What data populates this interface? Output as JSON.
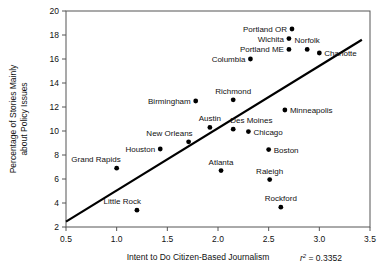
{
  "chart_data": {
    "type": "scatter",
    "title": "",
    "xlabel": "Intent to Do Citizen-Based Journalism",
    "ylabel_line1": "Percentage of Stories Mainly",
    "ylabel_line2": "about Policy Issues",
    "xlim": [
      0.5,
      3.5
    ],
    "ylim": [
      2,
      20
    ],
    "xticks": [
      0.5,
      1.0,
      1.5,
      2.0,
      2.5,
      3.0,
      3.5
    ],
    "xtick_labels": [
      "0.5",
      "1.0",
      "1.5",
      "2.0",
      "2.5",
      "3.0",
      "3.5"
    ],
    "yticks": [
      2,
      4,
      6,
      8,
      10,
      12,
      14,
      16,
      18,
      20
    ],
    "ytick_labels": [
      "2",
      "4",
      "6",
      "8",
      "10",
      "12",
      "14",
      "16",
      "18",
      "20"
    ],
    "grid": false,
    "legend": "none",
    "annotation_r2_label": "r",
    "annotation_r2_sup": "2",
    "annotation_r2_value": "= 0.3352",
    "annotation_r2_full": "r2 = 0.3352",
    "fit_line": {
      "x_start": 0.5,
      "y_start": 2.45,
      "x_end": 3.42,
      "y_end": 17.6
    },
    "points": [
      {
        "name": "Portland OR",
        "x": 2.73,
        "y": 18.5,
        "label_pos": "left"
      },
      {
        "name": "Wichita",
        "x": 2.7,
        "y": 17.7,
        "label_pos": "left"
      },
      {
        "name": "Norfolk",
        "x": 2.88,
        "y": 16.8,
        "label_pos": "above"
      },
      {
        "name": "Portland ME",
        "x": 2.7,
        "y": 16.8,
        "label_pos": "left"
      },
      {
        "name": "Charlotte",
        "x": 3.0,
        "y": 16.5,
        "label_pos": "right"
      },
      {
        "name": "Columbia",
        "x": 2.32,
        "y": 16.0,
        "label_pos": "left"
      },
      {
        "name": "Richmond",
        "x": 2.15,
        "y": 12.6,
        "label_pos": "above"
      },
      {
        "name": "Birmingham",
        "x": 1.78,
        "y": 12.5,
        "label_pos": "left"
      },
      {
        "name": "Minneapolis",
        "x": 2.66,
        "y": 11.75,
        "label_pos": "right"
      },
      {
        "name": "Austin",
        "x": 1.92,
        "y": 10.3,
        "label_pos": "above"
      },
      {
        "name": "Des Moines",
        "x": 2.15,
        "y": 10.15,
        "label_pos": "above-right"
      },
      {
        "name": "Chicago",
        "x": 2.3,
        "y": 9.95,
        "label_pos": "right"
      },
      {
        "name": "New Orleans",
        "x": 1.71,
        "y": 9.1,
        "label_pos": "above-left"
      },
      {
        "name": "Houston",
        "x": 1.43,
        "y": 8.5,
        "label_pos": "left"
      },
      {
        "name": "Boston",
        "x": 2.5,
        "y": 8.45,
        "label_pos": "right"
      },
      {
        "name": "Grand Rapids",
        "x": 1.0,
        "y": 6.9,
        "label_pos": "above-left"
      },
      {
        "name": "Atlanta",
        "x": 2.03,
        "y": 6.7,
        "label_pos": "above"
      },
      {
        "name": "Raleigh",
        "x": 2.51,
        "y": 5.95,
        "label_pos": "above"
      },
      {
        "name": "Rockford",
        "x": 2.62,
        "y": 3.65,
        "label_pos": "above"
      },
      {
        "name": "Little Rock",
        "x": 1.2,
        "y": 3.4,
        "label_pos": "above-left"
      }
    ]
  }
}
